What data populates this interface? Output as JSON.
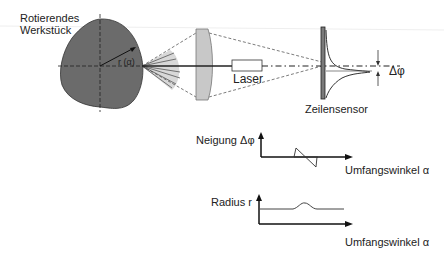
{
  "labels": {
    "workpiece_line1": "Rotierendes",
    "workpiece_line2": "Werkstück",
    "radius": "r (α)",
    "laser": "Laser",
    "sensor": "Zeilensensor",
    "delta_phi": "Δφ",
    "plot1_ylabel": "Neigung  Δφ",
    "plot1_xlabel": "Umfangswinkel α",
    "plot2_ylabel": "Radius r",
    "plot2_xlabel": "Umfangswinkel α"
  },
  "colors": {
    "workpiece": "#6b6b6b",
    "lens": "#c8c8c8",
    "fan": "#d8d8d8",
    "sensor": "#7a7a7a",
    "line": "#222222"
  }
}
